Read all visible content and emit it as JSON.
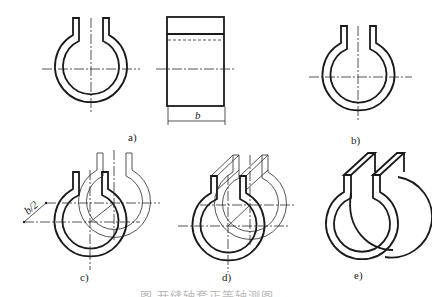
{
  "figure": {
    "views": [
      {
        "id": "a",
        "label": "a)",
        "description": "Front view and side view of split sleeve"
      },
      {
        "id": "b",
        "label": "b)",
        "description": "Front view of split sleeve"
      },
      {
        "id": "c",
        "label": "c)",
        "description": "Front and back faces offset by b/2 along oblique axis"
      },
      {
        "id": "d",
        "label": "d)",
        "description": "Connecting tab edges between front and back faces"
      },
      {
        "id": "e",
        "label": "e)",
        "description": "Finished oblique pictorial of split sleeve"
      }
    ],
    "dimension_width": "b",
    "dimension_offset": "b/2",
    "caption": "图 开缝轴套正等轴测图"
  },
  "colors": {
    "line": "#1a1a1a",
    "background": "#ffffff"
  }
}
